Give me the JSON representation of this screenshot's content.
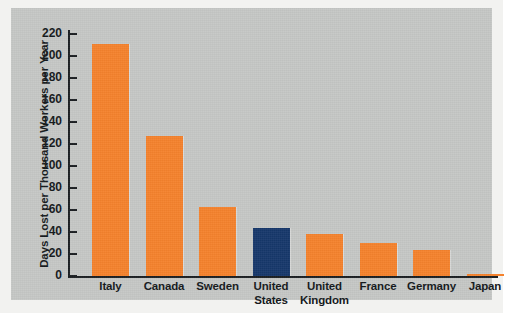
{
  "chart_data": {
    "type": "bar",
    "title": "",
    "subtitle": "",
    "xlabel": "",
    "ylabel": "Days Lost per Thousand Workers per Year",
    "categories": [
      "Italy",
      "Canada",
      "Sweden",
      "United States",
      "United Kingdom",
      "France",
      "Germany",
      "Japan"
    ],
    "values": [
      211,
      127,
      63,
      44,
      38,
      30,
      24,
      2
    ],
    "bar_colors": [
      "#f5822d",
      "#f5822d",
      "#f5822d",
      "#17386b",
      "#f5822d",
      "#f5822d",
      "#f5822d",
      "#f5822d"
    ],
    "highlighted_category": "United States",
    "ylim": [
      0,
      220
    ],
    "ytick_step": 20,
    "ytick_labels": [
      "0",
      "20",
      "40",
      "60",
      "80",
      "100",
      "120",
      "140",
      "160",
      "180",
      "200",
      "220"
    ],
    "grid": false,
    "legend": false,
    "legend_position": "none"
  },
  "colors": {
    "bar_orange": "#f5822d",
    "bar_navy": "#17386b",
    "panel_background": "#c6c8c6",
    "figure_background": "#f2f2f0",
    "axis": "#1b1f22",
    "text": "#15191c"
  }
}
